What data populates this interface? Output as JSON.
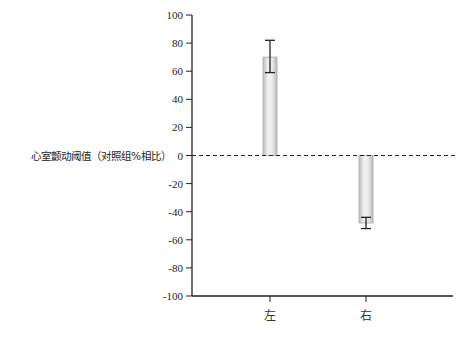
{
  "chart_data": {
    "type": "bar",
    "title": "",
    "xlabel": "",
    "ylabel": "心室颤动阈值（对照组%相比）",
    "categories": [
      "左",
      "右"
    ],
    "values": [
      70,
      -48
    ],
    "error_bars": [
      {
        "low": 59,
        "high": 82
      },
      {
        "low": -52,
        "high": -44
      }
    ],
    "ylim": [
      -100,
      100
    ],
    "yticks": [
      100,
      80,
      60,
      40,
      20,
      0,
      -20,
      -40,
      -60,
      -80,
      -100
    ],
    "ytick_labels": [
      "100",
      "80",
      "60",
      "40",
      "20",
      "0",
      "-20",
      "-40",
      "-60",
      "-80",
      "-100"
    ],
    "grid": false,
    "legend": null,
    "reference_line": {
      "y": 0,
      "style": "dashed"
    }
  },
  "colors": {
    "axis": "#222222",
    "bar_fill": "#e6e6e6",
    "bar_edge": "#b5b5b5"
  }
}
